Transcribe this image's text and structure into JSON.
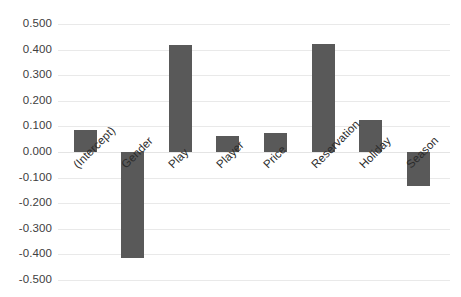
{
  "chart_data": {
    "type": "bar",
    "title": "",
    "xlabel": "",
    "ylabel": "",
    "ylim": [
      -0.5,
      0.5
    ],
    "grid": true,
    "legend": "none",
    "bar_color": "#595959",
    "gridline_color": "#e9e9e9",
    "categories": [
      "(Intercept)",
      "Gender",
      "Play",
      "Player",
      "Price",
      "Reservation",
      "Holiday",
      "Season"
    ],
    "values": [
      0.086,
      -0.414,
      0.418,
      0.063,
      0.074,
      0.422,
      0.125,
      -0.133
    ],
    "ytick_labels": [
      "0.500",
      "0.400",
      "0.300",
      "0.200",
      "0.100",
      "0.000",
      "-0.100",
      "-0.200",
      "-0.300",
      "-0.400",
      "-0.500"
    ],
    "ytick_values": [
      0.5,
      0.4,
      0.3,
      0.2,
      0.1,
      0.0,
      -0.1,
      -0.2,
      -0.3,
      -0.4,
      -0.5
    ]
  }
}
